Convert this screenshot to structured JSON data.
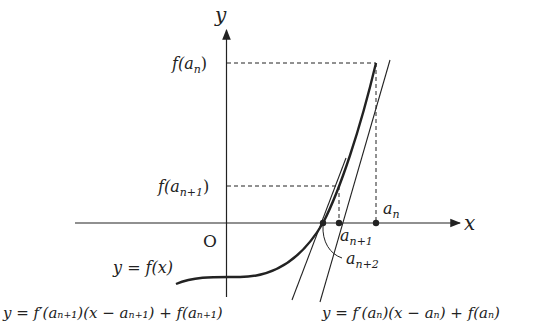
{
  "diagram": {
    "axes": {
      "x_label": "x",
      "y_label": "y",
      "origin_label": "O"
    },
    "curve_label": "y = f(x)",
    "points": [
      {
        "name": "a_n",
        "label_base": "a",
        "label_sub": "n"
      },
      {
        "name": "a_n+1",
        "label_base": "a",
        "label_sub": "n+1"
      },
      {
        "name": "a_n+2",
        "label_base": "a",
        "label_sub": "n+2"
      }
    ],
    "y_ticks": [
      {
        "label_pre": "f(a",
        "label_sub": "n",
        "label_post": ")"
      },
      {
        "label_pre": "f(a",
        "label_sub": "n+1",
        "label_post": ")"
      }
    ],
    "tangent_labels": {
      "at_a_n": "y = f′(aₙ)(x − aₙ) + f(aₙ)",
      "at_a_n1": "y = f′(aₙ₊₁)(x − aₙ₊₁) + f(aₙ₊₁)"
    },
    "colors": {
      "ink": "#222222",
      "background": "#ffffff"
    }
  }
}
